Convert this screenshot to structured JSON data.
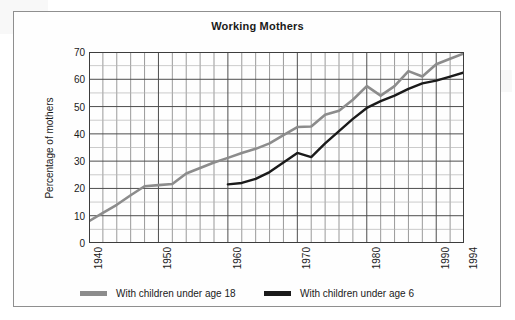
{
  "chart_data": {
    "type": "line",
    "title": "Working Mothers",
    "xlabel": "",
    "ylabel": "Percentage of mothers",
    "xlim": [
      1940,
      1994
    ],
    "ylim": [
      0,
      70
    ],
    "ytick_labels": [
      "0",
      "10",
      "20",
      "30",
      "40",
      "50",
      "60",
      "70"
    ],
    "ytick_values": [
      0,
      10,
      20,
      30,
      40,
      50,
      60,
      70
    ],
    "xtick_labels": [
      "1940",
      "1950",
      "1960",
      "1970",
      "1980",
      "1990",
      "1994"
    ],
    "xtick_values": [
      1940,
      1950,
      1960,
      1970,
      1980,
      1990,
      1994
    ],
    "grid": "major and minor, vertical every 2 years, horizontal every 5 percent",
    "legend_position": "below plot",
    "series": [
      {
        "name": "With children under age 18",
        "color": "#8c8c8c",
        "x": [
          1940,
          1942,
          1944,
          1946,
          1948,
          1950,
          1952,
          1954,
          1956,
          1958,
          1960,
          1962,
          1964,
          1966,
          1968,
          1970,
          1972,
          1974,
          1976,
          1978,
          1980,
          1982,
          1984,
          1986,
          1988,
          1990,
          1992,
          1994
        ],
        "values": [
          8,
          11,
          14,
          17.5,
          20.8,
          21.2,
          21.6,
          25.5,
          27.5,
          29.5,
          31.2,
          33,
          34.5,
          36.5,
          39.5,
          42.5,
          42.7,
          47,
          48.5,
          52.5,
          57.5,
          54,
          57.5,
          63,
          61,
          65.5,
          67.5,
          69.5
        ]
      },
      {
        "name": "With children under age 6",
        "color": "#1a1a1a",
        "x": [
          1960,
          1962,
          1964,
          1966,
          1968,
          1970,
          1972,
          1974,
          1976,
          1978,
          1980,
          1982,
          1984,
          1986,
          1988,
          1990,
          1992,
          1994
        ],
        "values": [
          21.5,
          22,
          23.5,
          26,
          29.5,
          33,
          31.5,
          36.5,
          41,
          45.5,
          49.5,
          52,
          54,
          56.5,
          58.5,
          59.5,
          61,
          62.5
        ]
      }
    ]
  },
  "legend": {
    "entries": [
      {
        "label": "With children under age 18",
        "color": "#8c8c8c"
      },
      {
        "label": "With children under age 6",
        "color": "#1a1a1a"
      }
    ]
  }
}
